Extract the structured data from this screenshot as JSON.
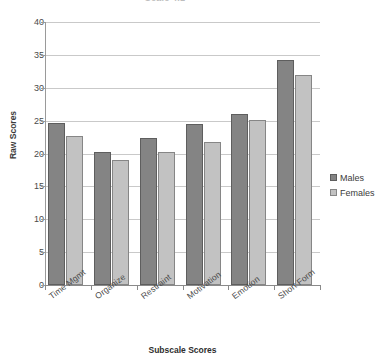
{
  "chart_data": {
    "type": "bar",
    "title": "Scale 4.1",
    "xlabel": "Subscale Scores",
    "ylabel": "Raw Scores",
    "ylim": [
      0,
      40
    ],
    "ytick_step": 5,
    "yticks": [
      40,
      35,
      30,
      25,
      20,
      15,
      10,
      5,
      0
    ],
    "grid": true,
    "legend_position": "right",
    "categories": [
      "Time Mgmt",
      "Organize",
      "Restraint",
      "Motivation",
      "Emotion",
      "Short Form"
    ],
    "series": [
      {
        "name": "Males",
        "color": "#848484",
        "values": [
          24.7,
          20.2,
          22.3,
          24.5,
          26.0,
          34.2
        ]
      },
      {
        "name": "Females",
        "color": "#c2c2c2",
        "values": [
          22.6,
          19.0,
          20.3,
          21.8,
          25.1,
          32.0
        ]
      }
    ]
  },
  "legend": {
    "items": [
      {
        "label": "Males",
        "swatch": "male-swatch"
      },
      {
        "label": "Females",
        "swatch": "female-swatch"
      }
    ]
  }
}
